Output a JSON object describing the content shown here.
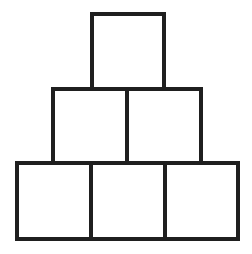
{
  "diagram": {
    "type": "block-pyramid",
    "rows": 3,
    "stroke_color": "#1f1f1f",
    "background": "#ffffff",
    "stroke_width": 4,
    "boxes": [
      {
        "row": 1,
        "col": 1,
        "x": 90,
        "y": 12,
        "w": 76,
        "h": 79
      },
      {
        "row": 2,
        "col": 1,
        "x": 51,
        "y": 87,
        "w": 78,
        "h": 78
      },
      {
        "row": 2,
        "col": 2,
        "x": 125,
        "y": 87,
        "w": 78,
        "h": 78
      },
      {
        "row": 3,
        "col": 1,
        "x": 15,
        "y": 161,
        "w": 78,
        "h": 80
      },
      {
        "row": 3,
        "col": 2,
        "x": 89,
        "y": 161,
        "w": 78,
        "h": 80
      },
      {
        "row": 3,
        "col": 3,
        "x": 163,
        "y": 161,
        "w": 77,
        "h": 80
      }
    ]
  }
}
